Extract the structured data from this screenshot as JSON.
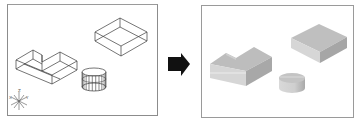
{
  "figure": {
    "left_panel": {
      "view": "wireframe",
      "objects": [
        "l-shaped-solid",
        "rectangular-box",
        "cylinder"
      ],
      "ucs_icon_labels": {
        "x": "X",
        "y": "Y",
        "z": "Z"
      }
    },
    "transition_arrow": {
      "direction": "right",
      "color": "#111111"
    },
    "right_panel": {
      "view": "shaded",
      "objects": [
        "l-shaped-solid",
        "rectangular-box",
        "cylinder"
      ],
      "shade_colors": {
        "top": "#c4c4c4",
        "left": "#d8d8d8",
        "right": "#a9a9a9"
      }
    }
  }
}
